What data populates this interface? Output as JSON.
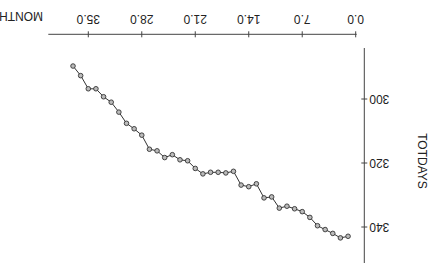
{
  "chart_data": {
    "type": "line",
    "title": "",
    "xlabel": "MONTH",
    "ylabel": "TOTDAYS",
    "xlim": [
      0,
      40
    ],
    "ylim": [
      285,
      350
    ],
    "x_ticks": [
      "0.0",
      "7.0",
      "14.0",
      "21.0",
      "28.0",
      "35.0"
    ],
    "x_tick_values": [
      0,
      7,
      14,
      21,
      28,
      35
    ],
    "y_ticks": [
      "300",
      "320",
      "340"
    ],
    "y_tick_values": [
      300,
      320,
      340
    ],
    "grid": false,
    "legend": null,
    "marker": "circle",
    "orientation_note": "image displayed rotated 180 degrees",
    "series": [
      {
        "name": "TOTDAYS",
        "x": [
          1,
          2,
          3,
          4,
          5,
          6,
          7,
          8,
          9,
          10,
          11,
          12,
          13,
          14,
          15,
          16,
          17,
          18,
          19,
          20,
          21,
          22,
          23,
          24,
          25,
          26,
          27,
          28,
          29,
          30,
          31,
          32,
          33,
          34,
          35,
          36,
          37
        ],
        "values": [
          342.9,
          343.4,
          342.0,
          340.8,
          339.6,
          337.0,
          335.2,
          334.3,
          333.5,
          334.1,
          330.6,
          330.9,
          326.5,
          327.4,
          326.9,
          322.6,
          323.1,
          322.9,
          322.9,
          323.4,
          321.7,
          319.3,
          319.0,
          317.4,
          318.3,
          316.2,
          315.7,
          311.3,
          309.3,
          307.6,
          304.1,
          301.0,
          299.3,
          296.8,
          296.8,
          292.7,
          289.7
        ]
      }
    ]
  }
}
